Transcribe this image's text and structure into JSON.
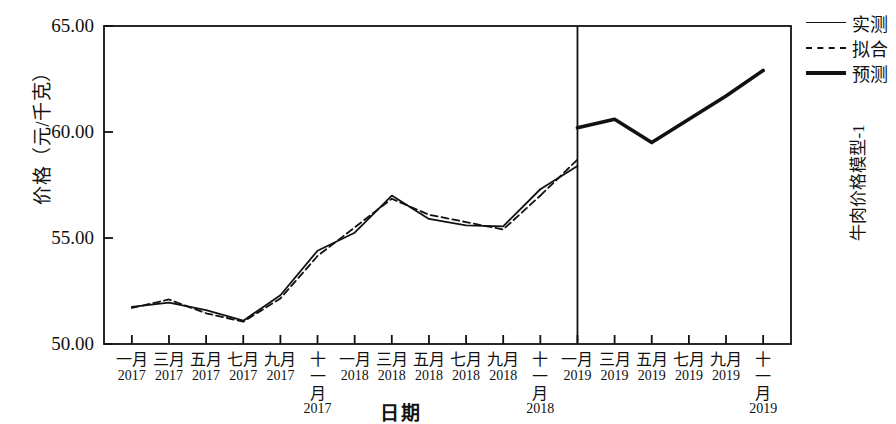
{
  "chart_data": {
    "type": "line",
    "title": "",
    "xlabel": "日期",
    "ylabel": "价格（元/千克）",
    "right_label": "牛肉价格模型-1",
    "ylim": [
      50.0,
      65.0
    ],
    "ytick_labels": [
      "65.00",
      "60.00",
      "55.00",
      "50.00"
    ],
    "ytick_values": [
      65.0,
      60.0,
      55.0,
      50.0
    ],
    "grid": false,
    "legend_position": "right-top",
    "legend": [
      {
        "name": "实测",
        "style": "solid-thin"
      },
      {
        "name": "拟合",
        "style": "dashed"
      },
      {
        "name": "预测",
        "style": "solid-thick"
      }
    ],
    "categories": [
      "一月 2017",
      "三月 2017",
      "五月 2017",
      "七月 2017",
      "九月 2017",
      "十一月 2017",
      "一月 2018",
      "三月 2018",
      "五月 2018",
      "七月 2018",
      "九月 2018",
      "十一月 2018",
      "一月 2019",
      "三月 2019",
      "五月 2019",
      "七月 2019",
      "九月 2019",
      "十一月 2019"
    ],
    "xtick_labels": [
      {
        "month": "一月",
        "year": "2017"
      },
      {
        "month": "三月",
        "year": "2017"
      },
      {
        "month": "五月",
        "year": "2017"
      },
      {
        "month": "七月",
        "year": "2017"
      },
      {
        "month": "九月",
        "year": "2017"
      },
      {
        "month": "十一月",
        "year": "2017"
      },
      {
        "month": "一月",
        "year": "2018"
      },
      {
        "month": "三月",
        "year": "2018"
      },
      {
        "month": "五月",
        "year": "2018"
      },
      {
        "month": "七月",
        "year": "2018"
      },
      {
        "month": "九月",
        "year": "2018"
      },
      {
        "month": "十一月",
        "year": "2018"
      },
      {
        "month": "一月",
        "year": "2019"
      },
      {
        "month": "三月",
        "year": "2019"
      },
      {
        "month": "五月",
        "year": "2019"
      },
      {
        "month": "七月",
        "year": "2019"
      },
      {
        "month": "九月",
        "year": "2019"
      },
      {
        "month": "十一月",
        "year": "2019"
      }
    ],
    "forecast_divider_category": "一月 2019",
    "series": [
      {
        "name": "实测",
        "style": "solid-thin",
        "x": [
          "一月 2017",
          "三月 2017",
          "五月 2017",
          "七月 2017",
          "九月 2017",
          "十一月 2017",
          "一月 2018",
          "三月 2018",
          "五月 2018",
          "七月 2018",
          "九月 2018",
          "十一月 2018"
        ],
        "values": [
          51.75,
          51.95,
          51.6,
          51.1,
          52.3,
          54.4,
          55.25,
          57.0,
          55.9,
          55.6,
          55.55,
          57.3
        ]
      },
      {
        "name": "拟合",
        "style": "dashed",
        "x": [
          "一月 2017",
          "三月 2017",
          "五月 2017",
          "七月 2017",
          "九月 2017",
          "十一月 2017",
          "一月 2018",
          "三月 2018",
          "五月 2018",
          "七月 2018",
          "九月 2018",
          "十一月 2018"
        ],
        "values": [
          51.7,
          52.1,
          51.45,
          51.05,
          52.15,
          54.15,
          55.5,
          56.85,
          56.1,
          55.75,
          55.4,
          57.0
        ]
      },
      {
        "name": "实测-尾段",
        "style": "solid-thin",
        "x": [
          "十一月 2018",
          "一月 2019"
        ],
        "values": [
          57.3,
          58.4
        ]
      },
      {
        "name": "拟合-尾段",
        "style": "dashed",
        "x": [
          "十一月 2018",
          "一月 2019"
        ],
        "values": [
          57.0,
          58.7
        ]
      },
      {
        "name": "预测",
        "style": "solid-thick",
        "x": [
          "一月 2019",
          "三月 2019",
          "五月 2019",
          "七月 2019",
          "九月 2019",
          "十一月 2019"
        ],
        "values": [
          60.2,
          60.6,
          59.5,
          60.6,
          61.7,
          62.9
        ]
      }
    ]
  }
}
